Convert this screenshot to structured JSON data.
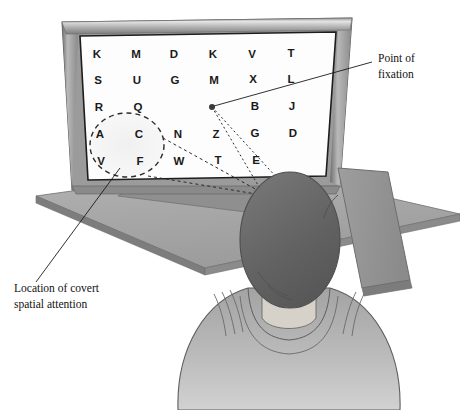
{
  "figure": {
    "background_color": "#ffffff"
  },
  "screen": {
    "background_color": "#fdfdfd",
    "letter_grid": {
      "rows": [
        [
          "K",
          "M",
          "D",
          "K",
          "V",
          "T"
        ],
        [
          "S",
          "U",
          "G",
          "M",
          "X",
          "L"
        ],
        [
          "R",
          "Q",
          "",
          "",
          "B",
          "J"
        ],
        [
          "A",
          "C",
          "N",
          "Z",
          "G",
          "D"
        ],
        [
          "V",
          "F",
          "W",
          "T",
          "E",
          ""
        ]
      ]
    }
  },
  "annotations": {
    "fixation": {
      "label_line_1": "Point of",
      "label_line_2": "fixation",
      "dot_color": "#3b3b3b"
    },
    "covert_attention": {
      "label_line_1": "Location of covert",
      "label_line_2": "spatial attention",
      "circle_style": "dashed"
    }
  },
  "colors": {
    "monitor_bezel": "#8e8e8e",
    "bezel_highlight": "#d8d8d8",
    "desk": "#a8a8a8",
    "desk_edge": "#7a7a7a",
    "hair": "#6b6b6b",
    "skin": "#c9c4bb",
    "shirt": "#b2b2b2",
    "chair": "#9a9a9a",
    "line": "#222222"
  }
}
